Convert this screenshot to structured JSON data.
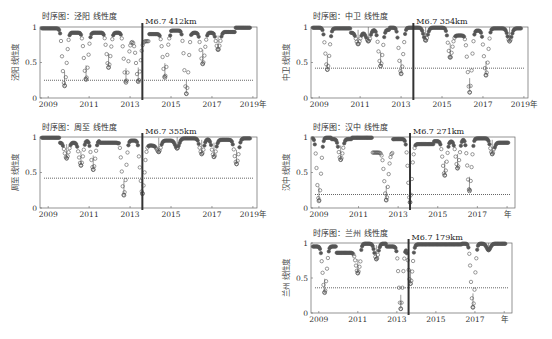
{
  "figure": {
    "marker_color": "#555555",
    "axis_color": "#666666",
    "threshold_color": "#555555",
    "eq_line_color": "#333333",
    "eq_year": 2013.6
  },
  "chart_data": [
    {
      "type": "scatter",
      "title": "时序图：泾阳 线性度",
      "annotation": "M6.7 412km",
      "ylabel": "泾阳 线性度",
      "xlabel_suffix": "年",
      "xticks": [
        "2009",
        "2011",
        "2013",
        "2015",
        "2017",
        "2019年"
      ],
      "xtick_years": [
        2009,
        2011,
        2013,
        2015,
        2017,
        2019
      ],
      "yticks": [
        "0",
        "0.5",
        "1"
      ],
      "xlim": [
        2008.6,
        2019.2
      ],
      "ylim": [
        0,
        1
      ],
      "threshold": 0.25,
      "eq_year": 2013.6,
      "dips": [
        {
          "x": 2009.8,
          "min": 0.17
        },
        {
          "x": 2010.85,
          "min": 0.26
        },
        {
          "x": 2011.95,
          "min": 0.43
        },
        {
          "x": 2012.8,
          "min": 0.22
        },
        {
          "x": 2013.4,
          "min": 0.23
        },
        {
          "x": 2014.7,
          "min": 0.29
        },
        {
          "x": 2015.75,
          "min": 0.06
        },
        {
          "x": 2016.55,
          "min": 0.48
        },
        {
          "x": 2017.3,
          "min": 0.68
        }
      ],
      "peaks": [
        0.98,
        0.92,
        0.92,
        0.92,
        0.8,
        0.9,
        0.95,
        0.92,
        0.93,
        0.99
      ]
    },
    {
      "type": "scatter",
      "title": "时序图：中卫 线性度",
      "annotation": "M6.7 354km",
      "ylabel": "中卫 线性度",
      "xticks": [
        "2009",
        "2011",
        "2013",
        "2015",
        "2017",
        "2019年"
      ],
      "xtick_years": [
        2009,
        2011,
        2013,
        2015,
        2017,
        2019
      ],
      "yticks": [
        "0",
        "0.5",
        "1"
      ],
      "xlim": [
        2008.6,
        2019.2
      ],
      "ylim": [
        0,
        1
      ],
      "threshold": 0.42,
      "eq_year": 2013.6,
      "dips": [
        {
          "x": 2009.4,
          "min": 0.4
        },
        {
          "x": 2010.9,
          "min": 0.76
        },
        {
          "x": 2011.4,
          "min": 0.8
        },
        {
          "x": 2012.0,
          "min": 0.45
        },
        {
          "x": 2013.0,
          "min": 0.34
        },
        {
          "x": 2014.2,
          "min": 0.81
        },
        {
          "x": 2015.4,
          "min": 0.57
        },
        {
          "x": 2016.35,
          "min": 0.08
        },
        {
          "x": 2017.15,
          "min": 0.32
        },
        {
          "x": 2018.3,
          "min": 0.8
        }
      ],
      "peaks": [
        0.99,
        0.98,
        0.92,
        0.96,
        0.99,
        0.99,
        0.99,
        0.88,
        0.95,
        0.98,
        0.98
      ]
    },
    {
      "type": "scatter",
      "title": "时序图：周至 线性度",
      "annotation": "M6.7 355km",
      "ylabel": "周至 线性度",
      "xticks": [
        "2009",
        "2011",
        "2013",
        "2015",
        "2017",
        "2019年"
      ],
      "xtick_years": [
        2009,
        2011,
        2013,
        2015,
        2017,
        2019
      ],
      "yticks": [
        "0",
        "0.5",
        "1"
      ],
      "xlim": [
        2008.6,
        2019.2
      ],
      "ylim": [
        0,
        1
      ],
      "threshold": 0.42,
      "eq_year": 2013.6,
      "dips": [
        {
          "x": 2009.9,
          "min": 0.7
        },
        {
          "x": 2010.6,
          "min": 0.6
        },
        {
          "x": 2011.2,
          "min": 0.54
        },
        {
          "x": 2012.7,
          "min": 0.18
        },
        {
          "x": 2013.6,
          "min": 0.2
        },
        {
          "x": 2014.4,
          "min": 0.79
        },
        {
          "x": 2015.3,
          "min": 0.84
        },
        {
          "x": 2016.5,
          "min": 0.76
        },
        {
          "x": 2017.1,
          "min": 0.72
        },
        {
          "x": 2018.2,
          "min": 0.62
        }
      ],
      "peaks": [
        0.99,
        0.92,
        0.95,
        0.92,
        0.95,
        0.88,
        0.95,
        0.98,
        0.97,
        0.96,
        0.98
      ]
    },
    {
      "type": "scatter",
      "title": "时序图：汉中 线性度",
      "annotation": "M6.7 271km",
      "ylabel": "汉中 线性度",
      "xticks": [
        "2009",
        "2011",
        "2013",
        "2015",
        "2017",
        "年"
      ],
      "xtick_years": [
        2009,
        2011,
        2013,
        2015,
        2017,
        2018.5
      ],
      "yticks": [
        "0",
        "0.5",
        "1"
      ],
      "xlim": [
        2008.6,
        2018.9
      ],
      "ylim": [
        0,
        1
      ],
      "threshold": 0.19,
      "eq_year": 2013.6,
      "dips": [
        {
          "x": 2009.0,
          "min": 0.1
        },
        {
          "x": 2010.1,
          "min": 0.68
        },
        {
          "x": 2012.4,
          "min": 0.11
        },
        {
          "x": 2013.6,
          "min": 0.08
        },
        {
          "x": 2015.35,
          "min": 0.46
        },
        {
          "x": 2016.0,
          "min": 0.56
        },
        {
          "x": 2016.6,
          "min": 0.24
        },
        {
          "x": 2017.75,
          "min": 0.76
        }
      ],
      "peaks": [
        0.99,
        0.97,
        0.99,
        0.78,
        0.97,
        0.9,
        0.94,
        0.97,
        0.98,
        0.92
      ]
    },
    {
      "type": "scatter",
      "title": "时序图：兰州 线性度",
      "annotation": "M6.7 179km",
      "ylabel": "兰州 线性度",
      "xticks": [
        "2009",
        "2011",
        "2013",
        "2015",
        "2017",
        "年"
      ],
      "xtick_years": [
        2009,
        2011,
        2013,
        2015,
        2017,
        2018.5
      ],
      "yticks": [
        "0",
        "0.5",
        "1"
      ],
      "xlim": [
        2008.6,
        2018.9
      ],
      "ylim": [
        0,
        1
      ],
      "threshold": 0.36,
      "eq_year": 2013.6,
      "dips": [
        {
          "x": 2009.3,
          "min": 0.29
        },
        {
          "x": 2011.0,
          "min": 0.57
        },
        {
          "x": 2011.95,
          "min": 0.77
        },
        {
          "x": 2013.2,
          "min": 0.06
        },
        {
          "x": 2013.7,
          "min": 0.42
        },
        {
          "x": 2016.9,
          "min": 0.08
        },
        {
          "x": 2017.7,
          "min": 0.9
        }
      ],
      "peaks": [
        0.95,
        0.86,
        0.99,
        0.95,
        0.98,
        0.98,
        0.99,
        0.99
      ]
    }
  ],
  "caption": ""
}
